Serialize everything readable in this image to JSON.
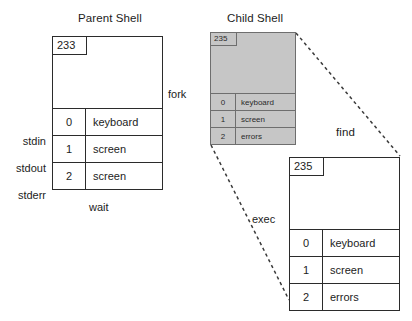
{
  "diagram": {
    "parent": {
      "title": "Parent Shell",
      "pid": "233",
      "fd_labels": [
        "stdin",
        "stdout",
        "stderr"
      ],
      "fd_rows": [
        {
          "num": "0",
          "device": "keyboard"
        },
        {
          "num": "1",
          "device": "screen"
        },
        {
          "num": "2",
          "device": "screen"
        }
      ],
      "caption": "wait"
    },
    "child": {
      "title": "Child Shell",
      "pid": "235",
      "fd_rows": [
        {
          "num": "0",
          "device": "keyboard"
        },
        {
          "num": "1",
          "device": "screen"
        },
        {
          "num": "2",
          "device": "errors"
        }
      ]
    },
    "find_process": {
      "title": "find",
      "pid": "235",
      "fd_rows": [
        {
          "num": "0",
          "device": "keyboard"
        },
        {
          "num": "1",
          "device": "screen"
        },
        {
          "num": "2",
          "device": "errors"
        }
      ]
    },
    "edges": {
      "fork": "fork",
      "exec": "exec"
    },
    "colors": {
      "shaded_fill": "#c6c6c6",
      "line": "#2b2b2b",
      "dashed_line": "#3a3a3a",
      "background": "#ffffff"
    }
  }
}
